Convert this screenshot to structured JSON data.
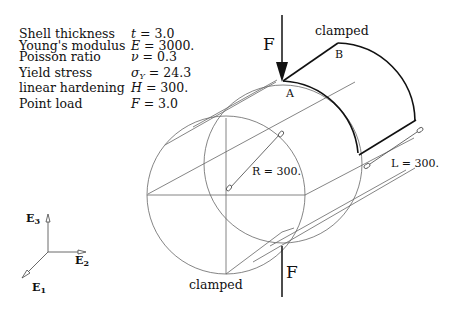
{
  "parameters": [
    {
      "label": "Shell thickness",
      "symbol": "t",
      "value": "3.0"
    },
    {
      "label": "Young's modulus",
      "symbol": "E",
      "value": "3000."
    },
    {
      "label": "Poisson ratio",
      "symbol": "ν",
      "value": "0.3"
    },
    {
      "label": "Yield stress",
      "symbol": "σ",
      "symbol_sub": "Y",
      "value": "24.3"
    },
    {
      "label": "linear hardening",
      "symbol": "H",
      "value": "300."
    },
    {
      "label": "Point load",
      "symbol": "F",
      "value": "3.0"
    }
  ],
  "labels": {
    "force_top": "F",
    "force_bottom": "F",
    "clamped_top": "clamped",
    "clamped_bottom": "clamped",
    "point_a": "A",
    "point_b": "B",
    "radius": "R = 300.",
    "length": "L = 300."
  },
  "axes": {
    "e1": {
      "base": "E",
      "sub": "1"
    },
    "e2": {
      "base": "E",
      "sub": "2"
    },
    "e3": {
      "base": "E",
      "sub": "3"
    }
  },
  "colors": {
    "line": "#555555",
    "bold_line": "#111111",
    "text": "#111111"
  }
}
